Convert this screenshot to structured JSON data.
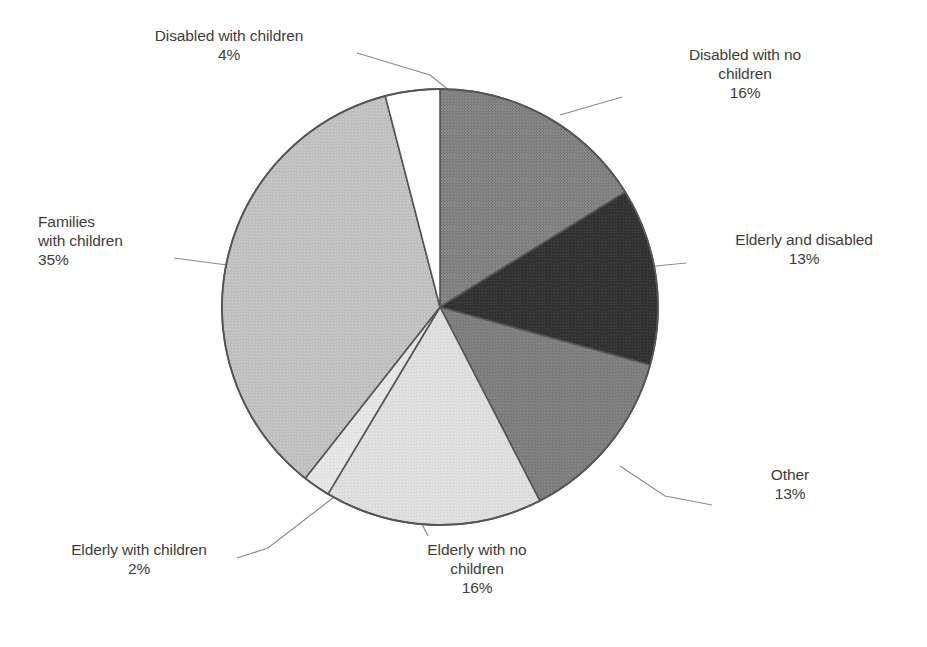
{
  "chart_data": {
    "type": "pie",
    "title": "",
    "subtitle": "",
    "xlabel": "",
    "ylabel": "",
    "legend_position": "none",
    "grid": false,
    "units": "percent",
    "start_angle_deg": 0,
    "direction": "clockwise",
    "categories": [
      "Disabled with no children",
      "Elderly and disabled",
      "Other",
      "Elderly with no children",
      "Elderly with children",
      "Families with children",
      "Disabled with children"
    ],
    "values": [
      16,
      13,
      13,
      16,
      2,
      35,
      4
    ],
    "colors": [
      "#808080",
      "#333333",
      "#7f7f7f",
      "#dcdcdc",
      "#e8e8e8",
      "#c0c0c0",
      "#ffffff"
    ],
    "slices": [
      {
        "label": "Disabled with no children",
        "value": 16,
        "value_text": "16%",
        "color": "#808080"
      },
      {
        "label": "Elderly and disabled",
        "value": 13,
        "value_text": "13%",
        "color": "#333333"
      },
      {
        "label": "Other",
        "value": 13,
        "value_text": "13%",
        "color": "#7f7f7f"
      },
      {
        "label": "Elderly with no children",
        "value": 16,
        "value_text": "16%",
        "color": "#dcdcdc"
      },
      {
        "label": "Elderly with children",
        "value": 2,
        "value_text": "2%",
        "color": "#e8e8e8"
      },
      {
        "label": "Families with children",
        "value": 35,
        "value_text": "35%",
        "color": "#c0c0c0"
      },
      {
        "label": "Disabled with children",
        "value": 4,
        "value_text": "4%",
        "color": "#ffffff"
      }
    ]
  },
  "labels": {
    "disabled_with_children": "Disabled with children\n4%",
    "disabled_with_no_children": "Disabled with no\nchildren\n16%",
    "elderly_and_disabled": "Elderly and disabled\n13%",
    "other": "Other\n13%",
    "elderly_with_no_children": "Elderly with no\nchildren\n16%",
    "elderly_with_children": "Elderly with children\n2%",
    "families_with_children": "Families\nwith children\n35%"
  },
  "style": {
    "outline_color": "#555555",
    "leader_color": "#8a8a8a",
    "background": "#ffffff",
    "text_color": "#3d3d3d"
  }
}
